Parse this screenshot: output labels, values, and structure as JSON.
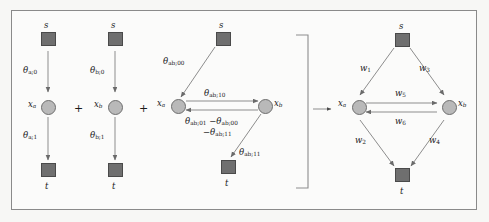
{
  "figure": {
    "type": "diagram",
    "background_color": "#fbfbfa",
    "border_color": "#8a8a8a",
    "node_square_color": "#6f6f6f",
    "node_circle_color": "#b9b9b9",
    "edge_color": "#8d8d8d"
  },
  "operators": {
    "plus_1": "+",
    "plus_2": "+",
    "implies_arrow": "→"
  },
  "panels": [
    {
      "id": "panel-unary-a",
      "nodes": {
        "source": "s",
        "variable": "x",
        "variable_sub": "a",
        "sink": "t"
      },
      "edges": [
        {
          "id": "s-to-xa",
          "label": "θ",
          "sub": "a;0"
        },
        {
          "id": "xa-to-t",
          "label": "θ",
          "sub": "a;1"
        }
      ]
    },
    {
      "id": "panel-unary-b",
      "nodes": {
        "source": "s",
        "variable": "x",
        "variable_sub": "b",
        "sink": "t"
      },
      "edges": [
        {
          "id": "s-to-xb",
          "label": "θ",
          "sub": "b;0"
        },
        {
          "id": "xb-to-t",
          "label": "θ",
          "sub": "b;1"
        }
      ]
    },
    {
      "id": "panel-pairwise-ab",
      "nodes": {
        "source": "s",
        "variable_a": "x",
        "variable_a_sub": "a",
        "variable_b": "x",
        "variable_b_sub": "b",
        "sink": "t"
      },
      "edges": [
        {
          "id": "s-to-xa",
          "label": "θ",
          "sub": "ab;00"
        },
        {
          "id": "xa-to-xb",
          "label": "θ",
          "sub": "ab;10"
        },
        {
          "id": "xb-to-xa-line1a",
          "label": "θ",
          "sub": "ab;01"
        },
        {
          "id": "xb-to-xa-minus1",
          "label": "−θ",
          "sub": "ab;00"
        },
        {
          "id": "xb-to-xa-line2",
          "label": "−θ",
          "sub": "ab;11"
        },
        {
          "id": "xb-to-t",
          "label": "θ",
          "sub": "ab;11"
        }
      ]
    },
    {
      "id": "panel-combined-network",
      "nodes": {
        "source": "s",
        "variable_a": "x",
        "variable_a_sub": "a",
        "variable_b": "x",
        "variable_b_sub": "b",
        "sink": "t"
      },
      "edges": [
        {
          "id": "s-to-xa",
          "label": "w",
          "sub": "1"
        },
        {
          "id": "xa-to-t",
          "label": "w",
          "sub": "2"
        },
        {
          "id": "s-to-xb",
          "label": "w",
          "sub": "3"
        },
        {
          "id": "xb-to-t",
          "label": "w",
          "sub": "4"
        },
        {
          "id": "xa-to-xb",
          "label": "w",
          "sub": "5"
        },
        {
          "id": "xb-to-xa",
          "label": "w",
          "sub": "6"
        }
      ]
    }
  ]
}
